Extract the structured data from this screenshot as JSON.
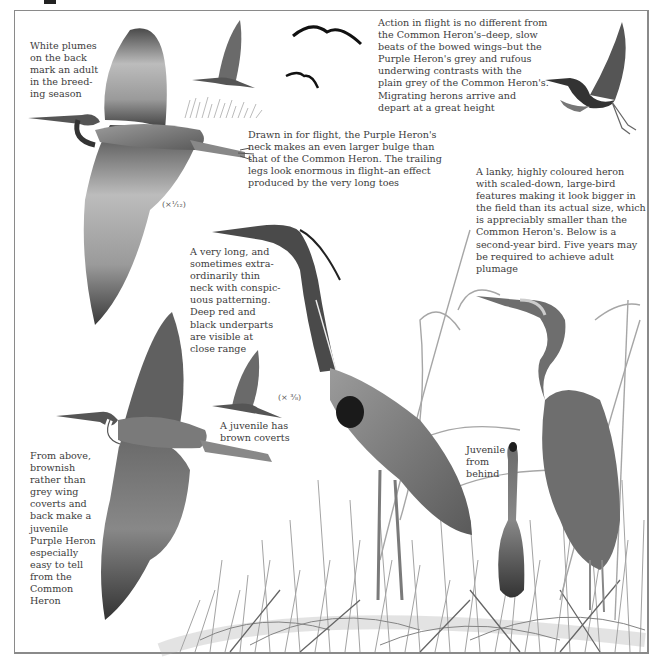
{
  "page": {
    "title_fragment": "p"
  },
  "illustration": {
    "subject": "Purple Heron",
    "figures": [
      {
        "id": "adult-flight-large",
        "label": "adult in flight, underside"
      },
      {
        "id": "small-flight-left",
        "label": "heron flying over reeds"
      },
      {
        "id": "distant-flight-1",
        "label": "distant silhouette"
      },
      {
        "id": "distant-flight-2",
        "label": "distant silhouette"
      },
      {
        "id": "flight-right",
        "label": "heron in flight, legs trailing"
      },
      {
        "id": "adult-standing",
        "label": "adult standing in reeds"
      },
      {
        "id": "second-year-standing",
        "label": "second-year bird standing"
      },
      {
        "id": "juvenile-behind",
        "label": "juvenile from behind"
      },
      {
        "id": "juvenile-flight-above",
        "label": "juvenile in flight from above"
      },
      {
        "id": "juvenile-flight-small",
        "label": "juvenile in flight, small"
      }
    ]
  },
  "captions": {
    "white_plumes": "White plumes\non the back\nmark an adult\nin the breed-\ning season",
    "action_in_flight": "Action in flight is no different from\nthe Common Heron's–deep, slow\nbeats of the bowed wings–but the\nPurple Heron's grey and rufous\nunderwing contrasts with the\nplain grey of the Common Heron's.\nMigrating herons arrive and\ndepart at a great height",
    "drawn_in": "Drawn in for flight, the Purple Heron's\nneck makes an even larger bulge than\nthat of the Common Heron. The trailing\nlegs look enormous in flight–an effect\nproduced by the very long toes",
    "lanky": "A lanky, highly coloured heron\nwith scaled-down, large-bird\nfeatures making it look bigger in\nthe field than its actual size, which\nis appreciably smaller than the\nCommon Heron's. Below is a\nsecond-year bird. Five years may\nbe required to achieve adult\nplumage",
    "long_neck": "A very long, and\nsometimes extra-\nordinarily thin\nneck with conspic-\nuous patterning.\nDeep red and\nblack underparts\nare visible at\nclose range",
    "juvenile_coverts": "A juvenile has\nbrown coverts",
    "juvenile_behind": "Juvenile\nfrom\nbehind",
    "from_above": "From above,\nbrownish\nrather than\ngrey wing\ncoverts and\nback make a\njuvenile\nPurple Heron\nespecially\neasy to tell\nfrom the\nCommon\nHeron"
  },
  "scales": {
    "flight_scale": "(×¹⁄₁₂)",
    "standing_scale": "(× ³⁄₈)"
  },
  "colors": {
    "frame": "#8a8a8a",
    "text": "#3c3c3c",
    "bird_dark": "#2b2b2b",
    "bird_mid": "#7a7a7a",
    "bird_light": "#bdbdbd",
    "reed": "#9a9a9a"
  }
}
